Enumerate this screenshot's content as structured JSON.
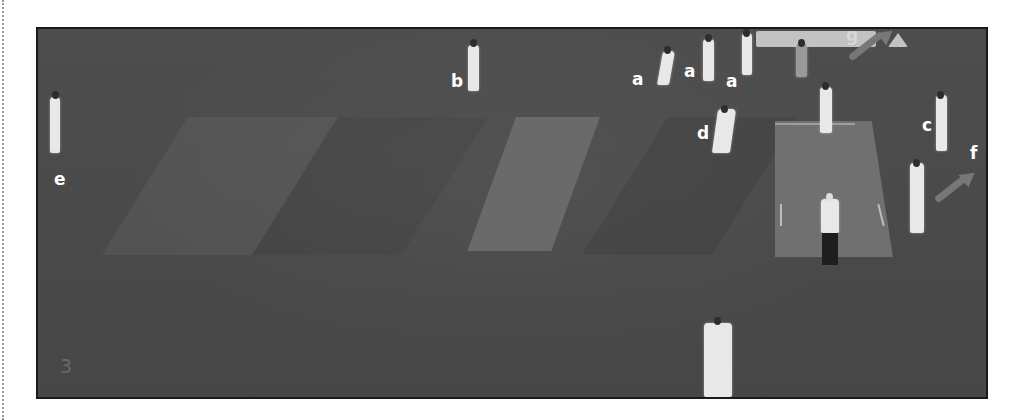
{
  "figure": {
    "panel_number": "3",
    "labels": [
      {
        "id": "a1",
        "text": "a"
      },
      {
        "id": "a2",
        "text": "a"
      },
      {
        "id": "a3",
        "text": "a"
      },
      {
        "id": "b",
        "text": "b"
      },
      {
        "id": "c",
        "text": "c"
      },
      {
        "id": "d",
        "text": "d"
      },
      {
        "id": "e",
        "text": "e"
      },
      {
        "id": "f",
        "text": "f"
      },
      {
        "id": "g",
        "text": "g"
      }
    ]
  },
  "colors": {
    "field": "#4a4a4a",
    "pitch": "#6e6e6e",
    "player": "#e8e8e8",
    "arrow": "#777777",
    "label": "#ffffff"
  }
}
